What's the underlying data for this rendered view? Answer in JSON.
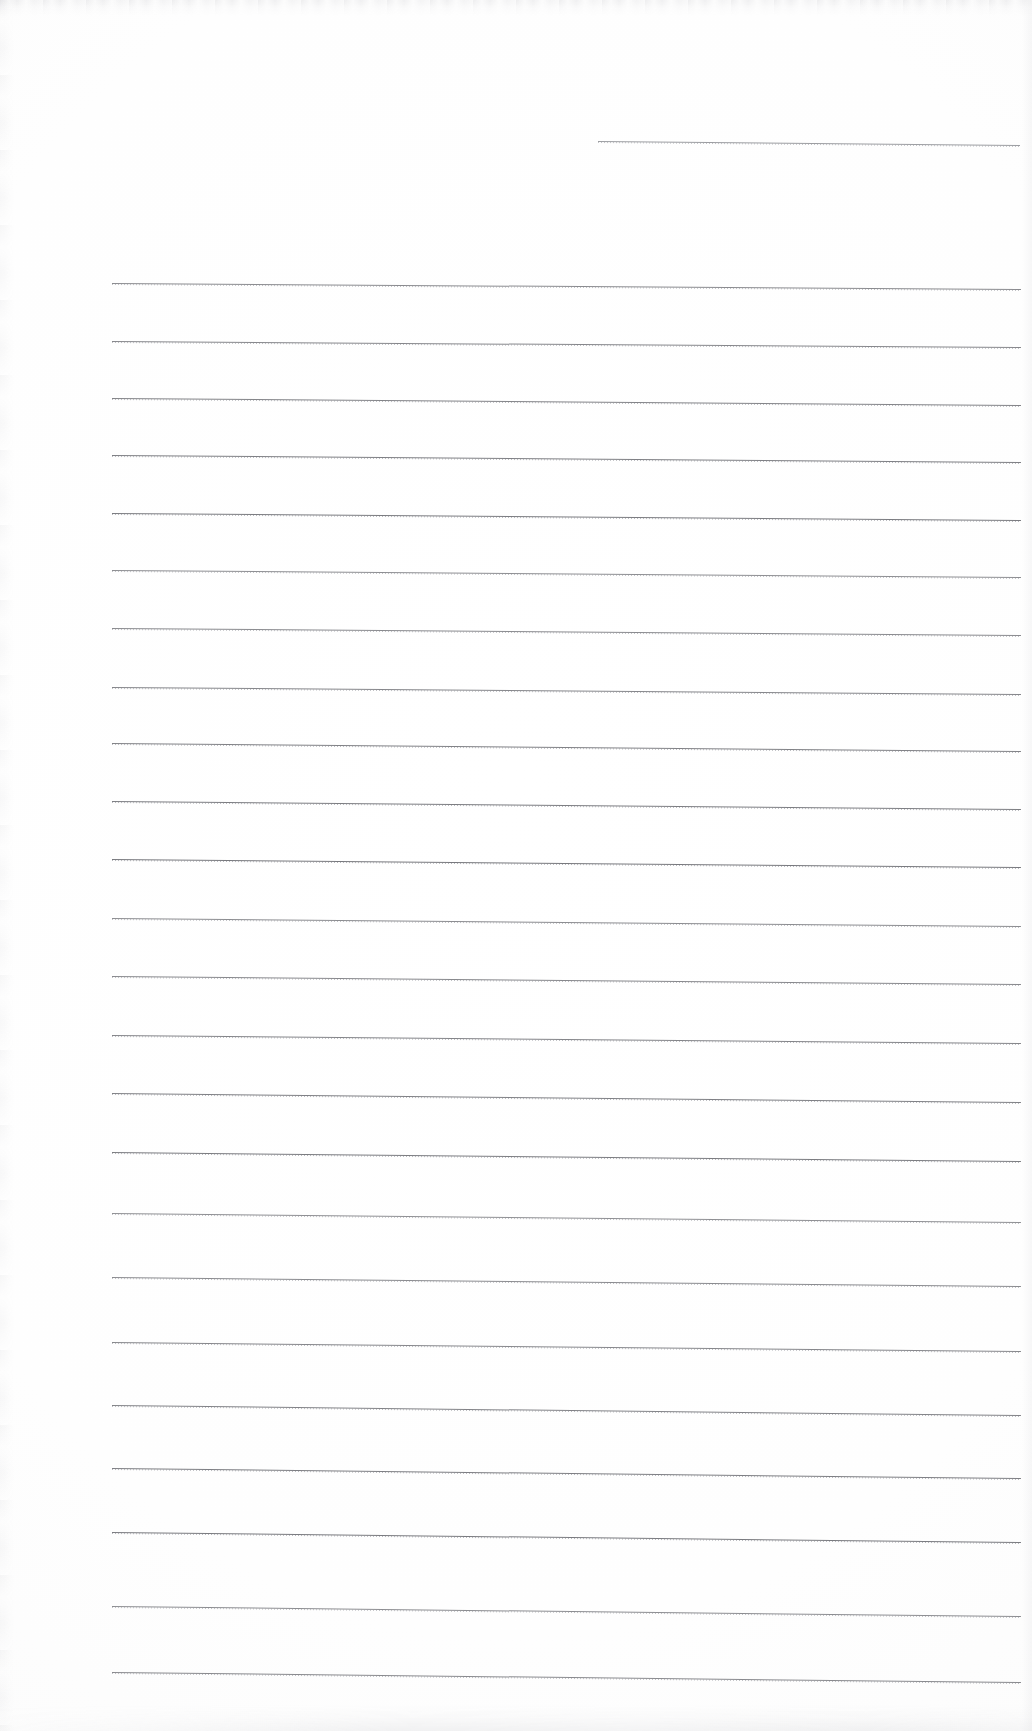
{
  "document": {
    "kind": "scanned-ruled-notebook-page",
    "title": "Blank Ruled Page",
    "page_width": 1032,
    "page_height": 1731,
    "background_color": "#ffffff",
    "rule_color": "#5a5c62",
    "text_content": "",
    "visible_text": [],
    "notes": "No text, headings, captions, page numbers or figures are present; the page is blank apart from horizontal ruled lines."
  },
  "rules": {
    "count": 24,
    "left_margin_x": 112,
    "right_margin_x": 1021,
    "header_rule": {
      "x1": 598,
      "x2": 1020,
      "y1": 141,
      "y2": 145,
      "width": 422,
      "label": "header-rule"
    },
    "body_lines": [
      {
        "x1": 112,
        "x2": 1021,
        "y1": 283,
        "y2": 289
      },
      {
        "x1": 112,
        "x2": 1021,
        "y1": 341,
        "y2": 347
      },
      {
        "x1": 112,
        "x2": 1021,
        "y1": 398,
        "y2": 405
      },
      {
        "x1": 112,
        "x2": 1021,
        "y1": 455,
        "y2": 462
      },
      {
        "x1": 112,
        "x2": 1021,
        "y1": 513,
        "y2": 520
      },
      {
        "x1": 112,
        "x2": 1021,
        "y1": 570,
        "y2": 577
      },
      {
        "x1": 112,
        "x2": 1021,
        "y1": 628,
        "y2": 635
      },
      {
        "x1": 112,
        "x2": 1021,
        "y1": 687,
        "y2": 694
      },
      {
        "x1": 112,
        "x2": 1021,
        "y1": 743,
        "y2": 751
      },
      {
        "x1": 112,
        "x2": 1021,
        "y1": 801,
        "y2": 809
      },
      {
        "x1": 112,
        "x2": 1021,
        "y1": 859,
        "y2": 867
      },
      {
        "x1": 112,
        "x2": 1021,
        "y1": 918,
        "y2": 926
      },
      {
        "x1": 112,
        "x2": 1021,
        "y1": 976,
        "y2": 984
      },
      {
        "x1": 112,
        "x2": 1021,
        "y1": 1035,
        "y2": 1043
      },
      {
        "x1": 112,
        "x2": 1021,
        "y1": 1093,
        "y2": 1102
      },
      {
        "x1": 112,
        "x2": 1021,
        "y1": 1152,
        "y2": 1161
      },
      {
        "x1": 112,
        "x2": 1021,
        "y1": 1213,
        "y2": 1222
      },
      {
        "x1": 112,
        "x2": 1021,
        "y1": 1277,
        "y2": 1286
      },
      {
        "x1": 112,
        "x2": 1021,
        "y1": 1342,
        "y2": 1351
      },
      {
        "x1": 112,
        "x2": 1021,
        "y1": 1405,
        "y2": 1415
      },
      {
        "x1": 112,
        "x2": 1021,
        "y1": 1468,
        "y2": 1478
      },
      {
        "x1": 112,
        "x2": 1021,
        "y1": 1532,
        "y2": 1542
      },
      {
        "x1": 112,
        "x2": 1021,
        "y1": 1606,
        "y2": 1616
      },
      {
        "x1": 112,
        "x2": 1021,
        "y1": 1672,
        "y2": 1682
      }
    ]
  }
}
